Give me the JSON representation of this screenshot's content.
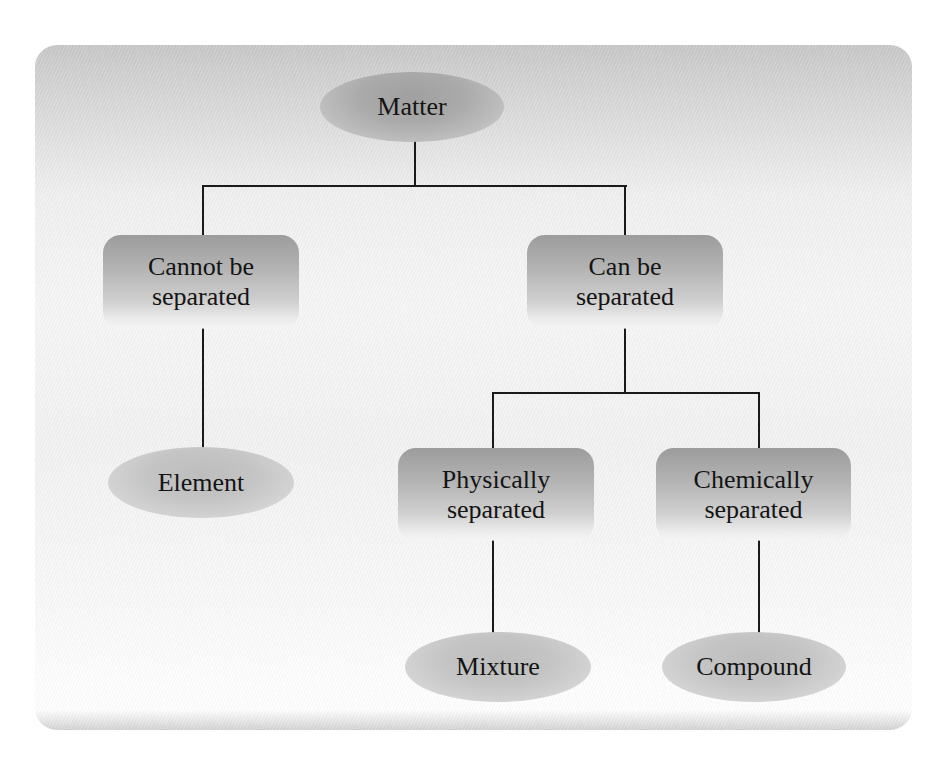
{
  "diagram": {
    "type": "tree",
    "root": {
      "id": "matter",
      "label": "Matter",
      "shape": "ellipse",
      "children": [
        "cannot_separated",
        "can_separated"
      ]
    },
    "nodes": {
      "matter": {
        "label": "Matter",
        "shape": "ellipse"
      },
      "cannot_separated": {
        "line1": "Cannot be",
        "line2": "separated",
        "shape": "rounded-box"
      },
      "can_separated": {
        "line1": "Can be",
        "line2": "separated",
        "shape": "rounded-box"
      },
      "element": {
        "label": "Element",
        "shape": "ellipse"
      },
      "physically_separated": {
        "line1": "Physically",
        "line2": "separated",
        "shape": "rounded-box"
      },
      "chemically_separated": {
        "line1": "Chemically",
        "line2": "separated",
        "shape": "rounded-box"
      },
      "mixture": {
        "label": "Mixture",
        "shape": "ellipse"
      },
      "compound": {
        "label": "Compound",
        "shape": "ellipse"
      }
    },
    "edges": [
      [
        "matter",
        "cannot_separated"
      ],
      [
        "matter",
        "can_separated"
      ],
      [
        "cannot_separated",
        "element"
      ],
      [
        "can_separated",
        "physically_separated"
      ],
      [
        "can_separated",
        "chemically_separated"
      ],
      [
        "physically_separated",
        "mixture"
      ],
      [
        "chemically_separated",
        "compound"
      ]
    ]
  },
  "colors": {
    "panel_top": "#c9c9c9",
    "panel_bottom": "#ffffff",
    "box_fill": "#b3b3b3",
    "line": "#1a1a1a",
    "text": "#141414"
  }
}
